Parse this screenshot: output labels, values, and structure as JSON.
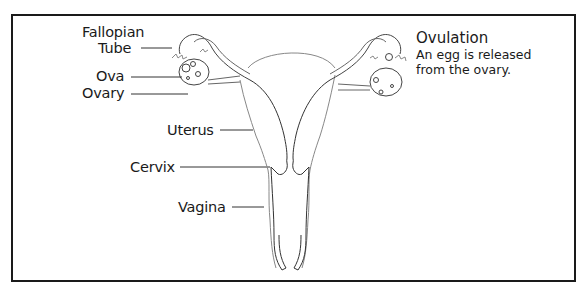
{
  "diagram": {
    "type": "anatomical-illustration",
    "labels": {
      "fallopian_tube_line1": "Fallopian",
      "fallopian_tube_line2": "Tube",
      "ova": "Ova",
      "ovary": "Ovary",
      "uterus": "Uterus",
      "cervix": "Cervix",
      "vagina": "Vagina"
    },
    "caption": {
      "title": "Ovulation",
      "line1": "An egg is released",
      "line2": "from the ovary."
    },
    "colors": {
      "frame": "#1a1a1a",
      "text": "#1a1a1a",
      "outline": "#555555",
      "background": "#ffffff"
    }
  }
}
